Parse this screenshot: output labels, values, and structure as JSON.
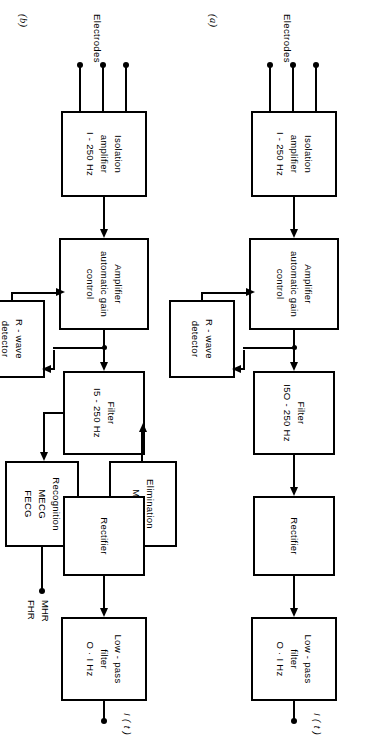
{
  "figure": {
    "type": "block-diagram",
    "orientation": "rotated-90",
    "panels": [
      {
        "id": "a",
        "label": "(a)",
        "source_label": "Electrodes",
        "electrode_count": 3,
        "output_label": "I ( t )",
        "blocks": [
          {
            "id": "isolation-amplifier",
            "lines": [
              "Isolation",
              "amplifier",
              "I - 250 Hz"
            ]
          },
          {
            "id": "amplifier-agc",
            "lines": [
              "Amplifier",
              "automatic gain",
              "control"
            ]
          },
          {
            "id": "r-wave-detector",
            "lines": [
              "R - wave",
              "detector"
            ]
          },
          {
            "id": "filter",
            "lines": [
              "Filter",
              "I5O - 250 Hz"
            ]
          },
          {
            "id": "rectifier",
            "lines": [
              "Rectifier"
            ]
          },
          {
            "id": "low-pass-filter",
            "lines": [
              "Low - pass",
              "filter",
              "O · I Hz"
            ]
          }
        ]
      },
      {
        "id": "b",
        "label": "(b)",
        "source_label": "Electrodes",
        "electrode_count": 3,
        "output_label": "I ( t )",
        "secondary_outputs": [
          "MHR",
          "FHR"
        ],
        "blocks": [
          {
            "id": "isolation-amplifier",
            "lines": [
              "Isolation",
              "amplifier",
              "I - 250 Hz"
            ]
          },
          {
            "id": "amplifier-agc",
            "lines": [
              "Amplifier",
              "automatic gain",
              "control"
            ]
          },
          {
            "id": "r-wave-detector",
            "lines": [
              "R - wave",
              "detector"
            ]
          },
          {
            "id": "filter",
            "lines": [
              "Filter",
              "I5 - 250 Hz"
            ]
          },
          {
            "id": "recognition",
            "lines": [
              "Recognition",
              "MECG",
              "FECG"
            ]
          },
          {
            "id": "elimination",
            "lines": [
              "Elimination",
              "MECG"
            ]
          },
          {
            "id": "rectifier",
            "lines": [
              "Rectifier"
            ]
          },
          {
            "id": "low-pass-filter",
            "lines": [
              "Low - pass",
              "filter",
              "O · I Hz"
            ]
          }
        ]
      }
    ],
    "colors": {
      "ink": "#000000",
      "paper": "#ffffff"
    }
  }
}
